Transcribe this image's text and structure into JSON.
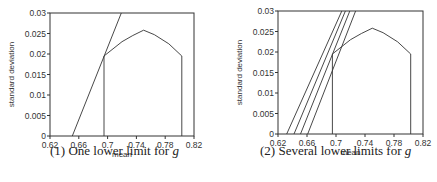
{
  "chart_data": [
    {
      "type": "line",
      "title": "(1) One lower limit for g",
      "caption_prefix": "(1) One lower limit for ",
      "caption_var": "g",
      "xlabel": "mean",
      "ylabel": "standard deviation",
      "xlim": [
        0.62,
        0.82
      ],
      "ylim": [
        0,
        0.03
      ],
      "xticks": [
        "0.62",
        "0.66",
        "0.7",
        "0.74",
        "0.78",
        "0.82"
      ],
      "yticks": [
        "0",
        "0.005",
        "0.01",
        "0.015",
        "0.02",
        "0.025",
        "0.03"
      ],
      "grid": false,
      "series": [
        {
          "name": "feasible-region",
          "x": [
            0.695,
            0.695,
            0.72,
            0.735,
            0.75,
            0.765,
            0.785,
            0.803,
            0.803
          ],
          "y": [
            0,
            0.0195,
            0.023,
            0.0245,
            0.0258,
            0.0247,
            0.0225,
            0.0195,
            0
          ]
        },
        {
          "name": "lower-limit-1",
          "x": [
            0.651,
            0.719
          ],
          "y": [
            0,
            0.03
          ]
        }
      ]
    },
    {
      "type": "line",
      "title": "(2) Several lower limits for g",
      "caption_prefix": "(2) Several lower limits for ",
      "caption_var": "g",
      "xlabel": "mean",
      "ylabel": "standard deviation",
      "xlim": [
        0.62,
        0.82
      ],
      "ylim": [
        0,
        0.03
      ],
      "xticks": [
        "0.62",
        "0.66",
        "0.7",
        "0.74",
        "0.78",
        "0.82"
      ],
      "yticks": [
        "0",
        "0.005",
        "0.01",
        "0.015",
        "0.02",
        "0.025",
        "0.03"
      ],
      "grid": false,
      "series": [
        {
          "name": "feasible-region",
          "x": [
            0.695,
            0.695,
            0.72,
            0.735,
            0.75,
            0.765,
            0.785,
            0.803,
            0.803
          ],
          "y": [
            0,
            0.0195,
            0.023,
            0.0245,
            0.0258,
            0.0247,
            0.0225,
            0.0195,
            0
          ]
        },
        {
          "name": "lower-limit-a",
          "x": [
            0.632,
            0.708
          ],
          "y": [
            0,
            0.03
          ]
        },
        {
          "name": "lower-limit-b",
          "x": [
            0.642,
            0.713
          ],
          "y": [
            0,
            0.03
          ]
        },
        {
          "name": "lower-limit-c",
          "x": [
            0.651,
            0.719
          ],
          "y": [
            0,
            0.03
          ]
        },
        {
          "name": "lower-limit-d",
          "x": [
            0.661,
            0.727
          ],
          "y": [
            0,
            0.03
          ]
        }
      ]
    }
  ]
}
